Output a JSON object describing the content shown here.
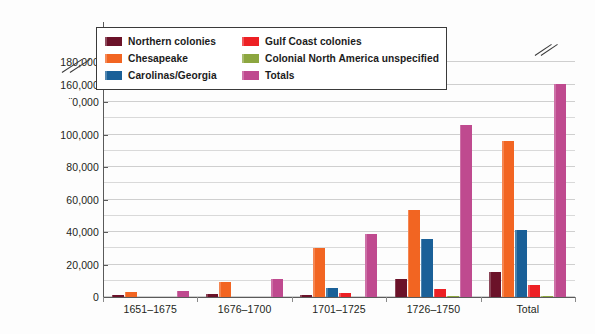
{
  "chart_data": {
    "type": "bar",
    "title": "",
    "subtitle": "",
    "xlabel": "",
    "ylabel": "",
    "ylim": [
      0,
      180000
    ],
    "ytick_step": 20000,
    "minor_gridline_step": 10000,
    "grid": true,
    "legend_position": "upper-left-inside",
    "axis_break": {
      "present": true,
      "between": [
        120000,
        160000
      ],
      "note": "double-slash break on y-axis; tick label below 160,000 is partially obscured by the break glyph"
    },
    "categories": [
      "1651–1675",
      "1676–1700",
      "1701–1725",
      "1726–1750",
      "Total"
    ],
    "series": [
      {
        "name": "Northern colonies",
        "color": "#6B1229",
        "values": [
          1000,
          1800,
          1500,
          11000,
          15500
        ]
      },
      {
        "name": "Chesapeake",
        "color": "#F26522",
        "values": [
          3000,
          9000,
          30000,
          53500,
          96000
        ]
      },
      {
        "name": "Carolinas/Georgia",
        "color": "#1A6098",
        "values": [
          0,
          0,
          5500,
          35500,
          41000
        ]
      },
      {
        "name": "Gulf Coast colonies",
        "color": "#ED2024",
        "values": [
          0,
          0,
          2300,
          4800,
          7200
        ]
      },
      {
        "name": "Colonial North America unspecified",
        "color": "#8CA63F",
        "values": [
          0,
          0,
          0,
          700,
          900
        ]
      },
      {
        "name": "Totals",
        "color": "#BF4A8F",
        "values": [
          4000,
          11000,
          39000,
          106000,
          161000
        ]
      }
    ],
    "ytick_labels": [
      "0",
      "20,000",
      "40,000",
      "60,000",
      "80,000",
      "100,000",
      "¨0,000",
      "160,000",
      "180,000"
    ],
    "ytick_values": [
      0,
      20000,
      40000,
      60000,
      80000,
      100000,
      120000,
      160000,
      180000
    ],
    "annotations": [
      {
        "kind": "axis-break",
        "target": "y-axis",
        "text": ""
      },
      {
        "kind": "axis-break",
        "target": "Totals bar, Total category",
        "text": ""
      }
    ]
  },
  "legend": {
    "entries": [
      {
        "label": "Northern colonies",
        "color": "#6B1229"
      },
      {
        "label": "Gulf Coast colonies",
        "color": "#ED2024"
      },
      {
        "label": "Chesapeake",
        "color": "#F26522"
      },
      {
        "label": "Colonial North America unspecified",
        "color": "#8CA63F"
      },
      {
        "label": "Carolinas/Georgia",
        "color": "#1A6098"
      },
      {
        "label": "Totals",
        "color": "#BF4A8F"
      }
    ]
  }
}
